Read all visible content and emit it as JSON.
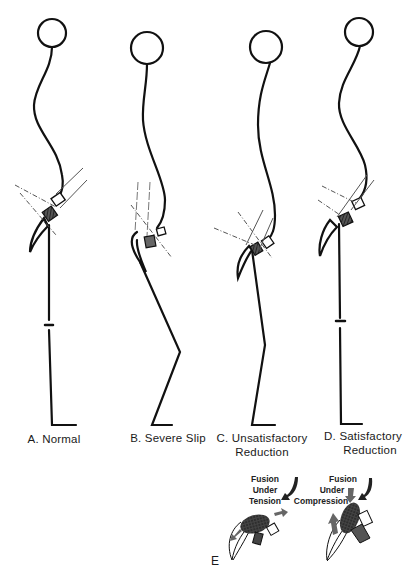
{
  "figure": {
    "panels": [
      {
        "id": "A",
        "label": "A. Normal"
      },
      {
        "id": "B",
        "label": "B. Severe Slip"
      },
      {
        "id": "C",
        "label_line1": "C. Unsatisfactory",
        "label_line2": "Reduction"
      },
      {
        "id": "D",
        "label_line1": "D. Satisfactory",
        "label_line2": "Reduction"
      }
    ],
    "panel_e": {
      "label": "E",
      "tension": {
        "line1": "Fusion",
        "line2": "Under",
        "line3": "Tension"
      },
      "compression": {
        "line1": "Fusion",
        "line2": "Under",
        "line3": "Compression"
      }
    },
    "colors": {
      "ink": "#111111",
      "arrow": "#666666",
      "hatch": "#333333",
      "background": "#ffffff"
    }
  }
}
